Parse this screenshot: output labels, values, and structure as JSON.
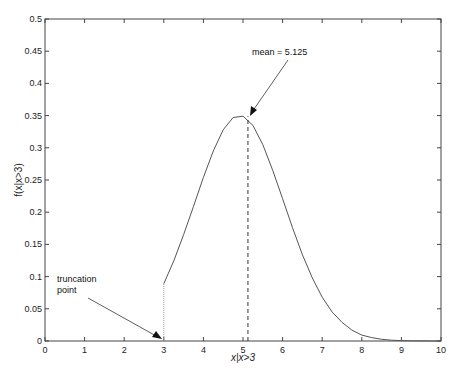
{
  "chart_data": {
    "type": "line",
    "title": "",
    "xlabel": "x|x>3",
    "ylabel": "f(x|x>3)",
    "xlim": [
      0,
      10
    ],
    "ylim": [
      0,
      0.5
    ],
    "grid": false,
    "legend": null,
    "x_ticks": [
      "0",
      "1",
      "2",
      "3",
      "4",
      "5",
      "6",
      "7",
      "8",
      "9",
      "10"
    ],
    "y_ticks": [
      "0",
      "0.05",
      "0.1",
      "0.15",
      "0.2",
      "0.25",
      "0.3",
      "0.35",
      "0.4",
      "0.45",
      "0.5"
    ],
    "series": [
      {
        "name": "truncated density",
        "x": [
          3.0,
          3.25,
          3.5,
          3.75,
          4.0,
          4.25,
          4.5,
          4.75,
          5.0,
          5.25,
          5.5,
          5.75,
          6.0,
          6.25,
          6.5,
          6.75,
          7.0,
          7.25,
          7.5,
          7.75,
          8.0,
          8.25,
          8.5,
          8.75,
          9.0,
          9.25,
          9.5,
          9.75,
          10.0
        ],
        "values": [
          0.089,
          0.124,
          0.165,
          0.209,
          0.254,
          0.295,
          0.328,
          0.347,
          0.349,
          0.335,
          0.305,
          0.265,
          0.221,
          0.176,
          0.134,
          0.098,
          0.068,
          0.045,
          0.029,
          0.017,
          0.0092,
          0.0053,
          0.0026,
          0.0012,
          0.0006,
          0.0003,
          0.0001,
          0.0,
          0.0
        ]
      }
    ],
    "annotations": [
      {
        "text": "mean = 5.125",
        "arrow_to": [
          5.125,
          0.349
        ],
        "dashed_vline_x": 5.125
      },
      {
        "text_lines": [
          "truncation",
          "point"
        ],
        "arrow_to": [
          3.0,
          0.0
        ],
        "dotted_vline_x": 3.0
      }
    ]
  },
  "labels": {
    "xlabel": "x|x>3",
    "ylabel": "f(x|x>3)",
    "mean_annotation": "mean = 5.125",
    "trunc_line1": "truncation",
    "trunc_line2": "point"
  }
}
